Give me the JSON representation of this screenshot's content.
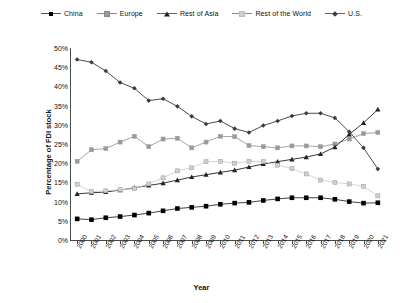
{
  "chart_data": {
    "type": "line",
    "title": "",
    "xlabel": "Year",
    "ylabel": "Percentage of FDI stock",
    "ylim": [
      0,
      50
    ],
    "ytick_labels": [
      "50%",
      "45%",
      "40%",
      "35%",
      "30%",
      "25%",
      "20%",
      "15%",
      "10%",
      "5%",
      "0%"
    ],
    "ytick_values": [
      50,
      45,
      40,
      35,
      30,
      25,
      20,
      15,
      10,
      5,
      0
    ],
    "grid": false,
    "legend_position": "top",
    "categories": [
      "2000",
      "2001",
      "2002",
      "2003",
      "2004",
      "2005",
      "2006",
      "2007",
      "2008",
      "2009",
      "2010",
      "2011",
      "2012",
      "2013",
      "2014",
      "2015",
      "2016",
      "2017",
      "2018",
      "2019",
      "2020",
      "2021"
    ],
    "series": [
      {
        "name": "China",
        "marker": "square-filled",
        "color": "#000000",
        "values": [
          5.5,
          5.3,
          5.8,
          6.1,
          6.5,
          7.0,
          7.6,
          8.2,
          8.5,
          8.8,
          9.3,
          9.6,
          9.8,
          10.3,
          10.7,
          11.0,
          11.0,
          11.0,
          10.6,
          10.0,
          9.6,
          9.7
        ]
      },
      {
        "name": "Europe",
        "marker": "square-gray",
        "color": "#9a9a9a",
        "values": [
          20.5,
          23.5,
          23.8,
          25.5,
          27.0,
          24.3,
          26.3,
          26.5,
          24.0,
          25.5,
          27.0,
          26.9,
          24.6,
          24.3,
          24.0,
          24.5,
          24.5,
          24.3,
          25.0,
          26.3,
          27.7,
          28.0
        ]
      },
      {
        "name": "Rest of Asia",
        "marker": "triangle",
        "color": "#222222",
        "values": [
          12.0,
          12.3,
          12.5,
          13.0,
          13.6,
          14.2,
          14.8,
          15.6,
          16.4,
          17.0,
          17.6,
          18.2,
          19.0,
          19.8,
          20.4,
          21.0,
          21.6,
          22.4,
          24.2,
          27.5,
          30.5,
          34.0
        ]
      },
      {
        "name": "Rest of the World",
        "marker": "square-light",
        "color": "#cfcfcf",
        "values": [
          14.5,
          12.6,
          12.8,
          13.1,
          13.4,
          14.6,
          16.2,
          18.0,
          18.8,
          20.4,
          20.5,
          20.0,
          20.5,
          20.4,
          19.5,
          18.6,
          17.2,
          15.6,
          15.0,
          14.6,
          14.0,
          11.5
        ]
      },
      {
        "name": "U.S.",
        "marker": "diamond",
        "color": "#3a3a3a",
        "values": [
          47.0,
          46.3,
          44.0,
          41.0,
          39.5,
          36.3,
          36.8,
          34.8,
          32.2,
          30.2,
          31.0,
          29.0,
          28.0,
          29.8,
          31.0,
          32.3,
          33.0,
          33.0,
          31.8,
          28.2,
          24.0,
          18.5
        ]
      }
    ]
  }
}
